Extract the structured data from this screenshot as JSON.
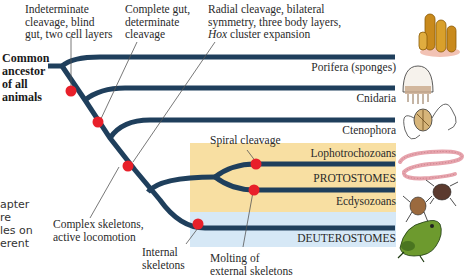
{
  "root": {
    "label_lines": [
      "Common",
      "ancestor",
      "of all",
      "animals"
    ]
  },
  "annotations": [
    {
      "id": "indeterminate",
      "lines": [
        "Indeterminate",
        "cleavage, blind",
        "gut, two cell layers"
      ]
    },
    {
      "id": "complete-gut",
      "lines": [
        "Complete gut,",
        "determinate",
        "cleavage"
      ]
    },
    {
      "id": "radial",
      "lines": [
        "Radial cleavage, bilateral",
        "symmetry, three body layers,"
      ],
      "italic_prefix": "Hox",
      "last_line_rest": " cluster expansion"
    },
    {
      "id": "spiral",
      "lines": [
        "Spiral cleavage"
      ]
    },
    {
      "id": "complex",
      "lines": [
        "Complex skeletons,",
        "active locomotion"
      ]
    },
    {
      "id": "internal",
      "lines": [
        "Internal",
        "skeletons"
      ]
    },
    {
      "id": "molting",
      "lines": [
        "Molting of",
        "external skeletons"
      ]
    }
  ],
  "taxa": [
    {
      "name": "Porifera (sponges)",
      "icon": "sponge-icon"
    },
    {
      "name": "Cnidaria",
      "icon": "jellyfish-icon"
    },
    {
      "name": "Ctenophora",
      "icon": "comb-jelly-icon"
    },
    {
      "name": "Lophotrochozoans",
      "icon": "worm-icon"
    },
    {
      "name": "Ecdysozoans",
      "icon": "mite-icon"
    },
    {
      "name": "DEUTEROSTOMES",
      "icon": "frog-icon"
    }
  ],
  "groups": {
    "protostomes": "PROTOSTOMES"
  },
  "background_text": [
    "apter",
    "re",
    "les on",
    "erent"
  ],
  "colors": {
    "branch": "#1f3f5c",
    "node": "#e8202a",
    "protostome_box": "#f8dfa2",
    "deuterostome_box": "#d6e8f6"
  }
}
